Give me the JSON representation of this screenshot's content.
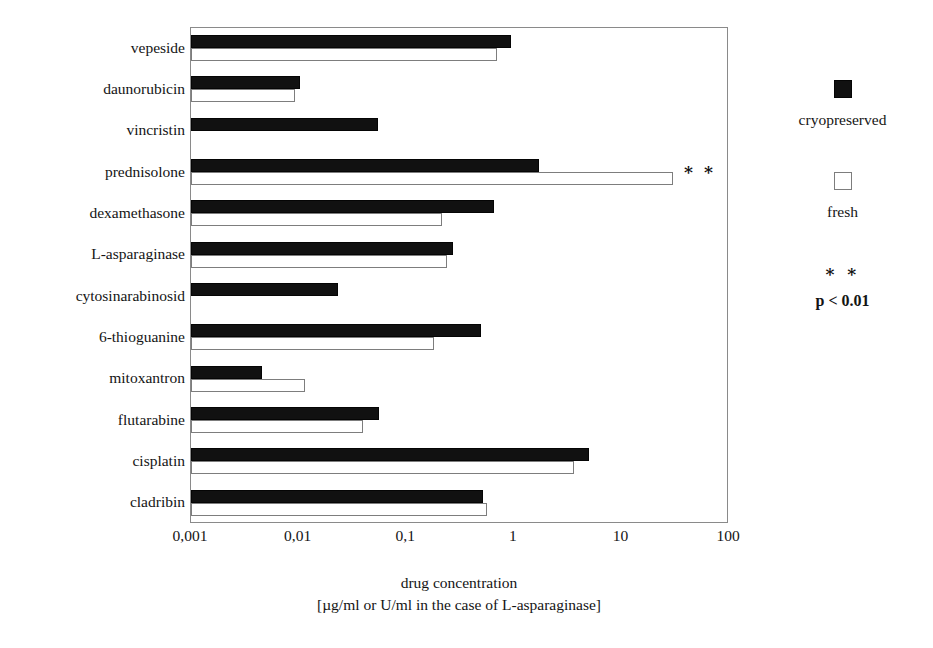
{
  "chart_data": {
    "type": "bar",
    "orientation": "horizontal",
    "title": "",
    "xlabel": "drug concentration",
    "xlabel_line2": "[µg/ml or U/ml in the case of L-asparaginase]",
    "ylabel": "",
    "xscale": "log",
    "xlim": [
      0.001,
      100
    ],
    "xticks": [
      0.001,
      0.01,
      0.1,
      1,
      10,
      100
    ],
    "xticklabels": [
      "0,001",
      "0,01",
      "0,1",
      "1",
      "10",
      "100"
    ],
    "grid": false,
    "legend_position": "right",
    "categories": [
      "vepeside",
      "daunorubicin",
      "vincristin",
      "prednisolone",
      "dexamethasone",
      "L-asparaginase",
      "cytosinarabinosid",
      "6-thioguanine",
      "mitoxantron",
      "flutarabine",
      "cisplatin",
      "cladribin"
    ],
    "series": [
      {
        "name": "cryopreserved",
        "color": "#111111",
        "values": [
          0.95,
          0.0103,
          0.055,
          1.7,
          0.65,
          0.27,
          0.023,
          0.5,
          0.0046,
          0.056,
          5.0,
          0.52
        ]
      },
      {
        "name": "fresh",
        "color": "#ffffff",
        "values": [
          0.7,
          0.0093,
          null,
          30.0,
          0.215,
          0.24,
          null,
          0.18,
          0.0115,
          0.04,
          3.6,
          0.56
        ]
      }
    ],
    "annotations": [
      {
        "category": "prednisolone",
        "text": "∗ ∗",
        "meaning": "p < 0.01"
      }
    ]
  },
  "legend": {
    "entries": [
      {
        "swatch": "filled-square",
        "label": "cryopreserved"
      },
      {
        "swatch": "hollow-square",
        "label": "fresh"
      }
    ],
    "note_stars": "∗ ∗",
    "note_text": "p < 0.01"
  },
  "colors": {
    "cryopreserved": "#111111",
    "fresh": "#ffffff",
    "axis": "#8a8a8a",
    "text": "#141414"
  }
}
